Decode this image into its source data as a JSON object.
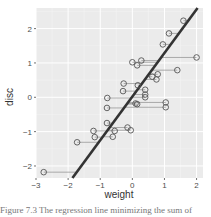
{
  "chart_data": {
    "type": "scatter",
    "title": "",
    "xlabel": "weight",
    "ylabel": "disc",
    "xlim": [
      -3.0,
      2.2
    ],
    "ylim": [
      -2.35,
      2.6
    ],
    "x_ticks": [
      -3,
      -2,
      -1,
      0,
      1,
      2
    ],
    "y_ticks": [
      -2,
      -1,
      0,
      1,
      2
    ],
    "x_tick_labels": [
      "-3",
      "-2",
      "-1",
      "0",
      "1",
      "2"
    ],
    "y_tick_labels": [
      "-2",
      "-1",
      "0",
      "1",
      "2"
    ],
    "grid": true,
    "legend": null,
    "regression_line": {
      "intercept": 0.02,
      "slope": 1.27
    },
    "points": [
      {
        "x": 1.59,
        "y": 2.23
      },
      {
        "x": 1.14,
        "y": 1.86
      },
      {
        "x": 0.95,
        "y": 1.54
      },
      {
        "x": 2.0,
        "y": 1.16
      },
      {
        "x": 0.0,
        "y": 1.02
      },
      {
        "x": 0.28,
        "y": 1.07
      },
      {
        "x": 0.15,
        "y": 0.93
      },
      {
        "x": 1.4,
        "y": 0.79
      },
      {
        "x": 0.79,
        "y": 0.67
      },
      {
        "x": 0.75,
        "y": 0.52
      },
      {
        "x": 0.62,
        "y": 0.6
      },
      {
        "x": -0.27,
        "y": 0.4
      },
      {
        "x": -0.29,
        "y": 0.18
      },
      {
        "x": 0.4,
        "y": 0.22
      },
      {
        "x": 0.4,
        "y": 0.08
      },
      {
        "x": 0.4,
        "y": 0.0
      },
      {
        "x": 0.17,
        "y": 0.35
      },
      {
        "x": -0.78,
        "y": -0.02
      },
      {
        "x": 1.04,
        "y": -0.15
      },
      {
        "x": 1.04,
        "y": -0.29
      },
      {
        "x": 0.15,
        "y": -0.2
      },
      {
        "x": 0.1,
        "y": -0.18
      },
      {
        "x": -0.79,
        "y": -0.31
      },
      {
        "x": -0.79,
        "y": -0.75
      },
      {
        "x": -0.15,
        "y": -0.88
      },
      {
        "x": -0.05,
        "y": -0.96
      },
      {
        "x": -1.21,
        "y": -0.98
      },
      {
        "x": -0.55,
        "y": -0.98
      },
      {
        "x": -1.17,
        "y": -1.16
      },
      {
        "x": -0.61,
        "y": -1.15
      },
      {
        "x": -1.72,
        "y": -1.31
      },
      {
        "x": -2.76,
        "y": -2.18
      }
    ],
    "colors": {
      "panel_bg": "#ebebeb",
      "grid_major": "#ffffff",
      "grid_minor": "#f5f5f5",
      "point_stroke": "#555555",
      "segment": "#999999",
      "line": "#333333",
      "axis_text": "#4d4d4d"
    }
  },
  "caption": "Figure 7.3 The regression line minimizing the sum of"
}
